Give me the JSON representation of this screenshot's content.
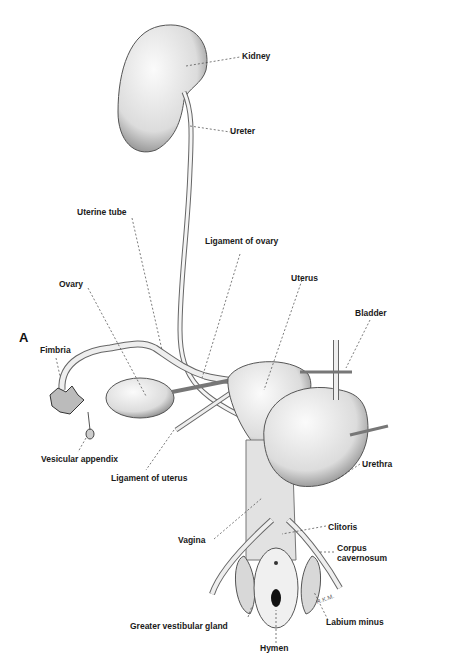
{
  "panel_letter": "A",
  "labels": {
    "kidney": "Kidney",
    "ureter": "Ureter",
    "uterine_tube": "Uterine tube",
    "ligament_of_ovary": "Ligament of ovary",
    "ovary": "Ovary",
    "uterus": "Uterus",
    "bladder": "Bladder",
    "fimbria": "Fimbria",
    "vesicular_appendix": "Vesicular appendix",
    "ligament_of_uterus": "Ligament of uterus",
    "urethra": "Urethra",
    "vagina": "Vagina",
    "clitoris": "Clitoris",
    "corpus_cavernosum_1": "Corpus",
    "corpus_cavernosum_2": "cavernosum",
    "greater_vestibular_gland": "Greater vestibular gland",
    "labium_minus": "Labium minus",
    "hymen": "Hymen"
  },
  "signature": "R.K.M."
}
